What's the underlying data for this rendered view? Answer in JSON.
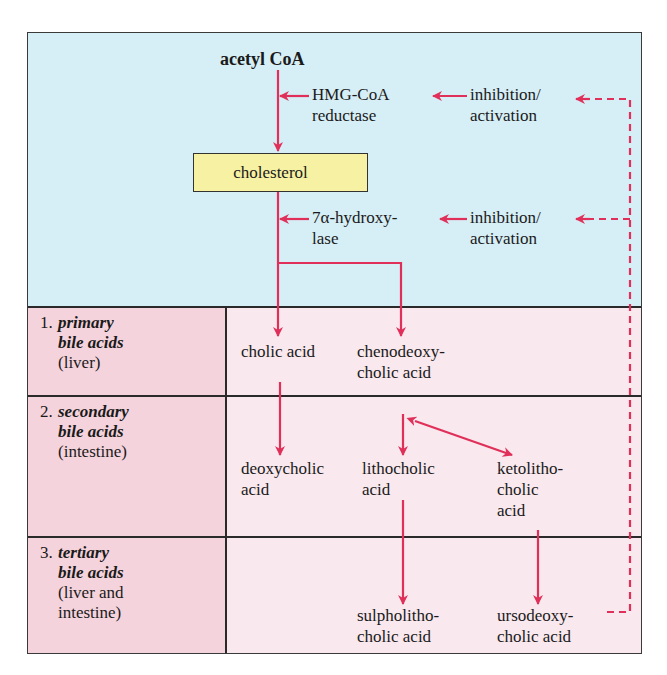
{
  "diagram": {
    "colors": {
      "arrow": "#e0305a",
      "synthesis_bg": "#d6eef6",
      "category_bg": "#f5d3dc",
      "content_bg": "#f9e8ee",
      "cholesterol_box": "#f7f1a3",
      "border": "#2a2a2a"
    },
    "synthesis": {
      "start": "acetyl CoA",
      "enzyme1": {
        "line1": "HMG-CoA",
        "line2": "reductase"
      },
      "regulation1": {
        "line1": "inhibition/",
        "line2": "activation"
      },
      "intermediate": "cholesterol",
      "enzyme2": {
        "line1": "7α-hydroxy-",
        "line2": "lase"
      },
      "regulation2": {
        "line1": "inhibition/",
        "line2": "activation"
      }
    },
    "categories": [
      {
        "num": "1.",
        "name": "primary",
        "line2": "bile acids",
        "line3": "(liver)",
        "line4": ""
      },
      {
        "num": "2.",
        "name": "secondary",
        "line2": "bile acids",
        "line3": "(intestine)",
        "line4": ""
      },
      {
        "num": "3.",
        "name": "tertiary",
        "line2": "bile acids",
        "line3": "(liver and",
        "line4": "intestine)"
      }
    ],
    "acids": {
      "cholic": {
        "line1": "cholic acid"
      },
      "chenodeoxycholic": {
        "line1": "chenodeoxy-",
        "line2": "cholic acid"
      },
      "deoxycholic": {
        "line1": "deoxycholic",
        "line2": "acid"
      },
      "lithocholic": {
        "line1": "lithocholic",
        "line2": "acid"
      },
      "ketolithocholic": {
        "line1": "ketolitho-",
        "line2": "cholic",
        "line3": "acid"
      },
      "sulpholithocholic": {
        "line1": "sulpholitho-",
        "line2": "cholic acid"
      },
      "ursodeoxycholic": {
        "line1": "ursodeoxy-",
        "line2": "cholic acid"
      }
    }
  }
}
